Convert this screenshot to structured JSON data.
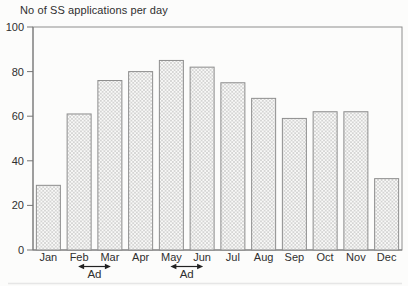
{
  "chart_data": {
    "type": "bar",
    "title": "No of SS applications per day",
    "categories": [
      "Jan",
      "Feb",
      "Mar",
      "Apr",
      "May",
      "Jun",
      "Jul",
      "Aug",
      "Sep",
      "Oct",
      "Nov",
      "Dec"
    ],
    "values": [
      29,
      61,
      76,
      80,
      85,
      82,
      75,
      68,
      59,
      62,
      62,
      32
    ],
    "xlabel": "",
    "ylabel": "",
    "ylim": [
      0,
      100
    ],
    "yticks": [
      0,
      20,
      40,
      60,
      80,
      100
    ],
    "grid": false,
    "legend": "none",
    "bar_pattern": "diagonal-crosshatch",
    "annotations": [
      {
        "label": "Ad",
        "from_category": "Feb",
        "to_category": "Mar",
        "arrow": "double-headed"
      },
      {
        "label": "Ad",
        "from_category": "May",
        "to_category": "Jun",
        "arrow": "double-headed"
      }
    ],
    "colors": {
      "background": "#fcfcfb",
      "axis": "#8e8e8e",
      "axis_dark": "#767676",
      "bar_fill": "#f9f9f8",
      "bar_hatch": "#c9c9c9",
      "bar_border": "#8e8e8e",
      "text": "#2f2f2f",
      "annotation": "#222222",
      "artifact_line": "#e4e4e4"
    }
  }
}
